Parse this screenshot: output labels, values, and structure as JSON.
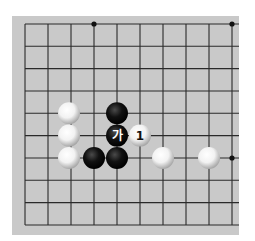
{
  "board": {
    "background": "#c9c9c9",
    "line_color": "#2a2a2a",
    "columns_x": [
      25,
      48,
      71,
      94,
      117,
      140,
      163,
      186,
      209,
      232
    ],
    "rows_y": [
      24,
      46.3,
      68.6,
      91,
      113.3,
      135.6,
      158,
      180.3,
      202.6,
      225
    ],
    "open_edge": "right-extends",
    "star_points": [
      {
        "col": 3,
        "row": 0
      },
      {
        "col": 9,
        "row": 0
      },
      {
        "col": 9,
        "row": 6
      }
    ]
  },
  "stones": [
    {
      "color": "white",
      "col": 2,
      "row": 4,
      "label": ""
    },
    {
      "color": "white",
      "col": 2,
      "row": 5,
      "label": ""
    },
    {
      "color": "white",
      "col": 2,
      "row": 6,
      "label": ""
    },
    {
      "color": "black",
      "col": 3,
      "row": 6,
      "label": ""
    },
    {
      "color": "black",
      "col": 4,
      "row": 4,
      "label": ""
    },
    {
      "color": "black",
      "col": 4,
      "row": 5,
      "label": "가"
    },
    {
      "color": "black",
      "col": 4,
      "row": 6,
      "label": ""
    },
    {
      "color": "white",
      "col": 5,
      "row": 5,
      "label": "1"
    },
    {
      "color": "white",
      "col": 6,
      "row": 6,
      "label": ""
    },
    {
      "color": "white",
      "col": 8,
      "row": 6,
      "label": ""
    }
  ],
  "labels": {
    "marker_ga": "가",
    "move_1": "1"
  }
}
